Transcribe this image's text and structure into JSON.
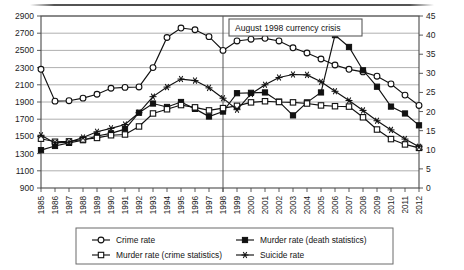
{
  "chart_data": {
    "type": "line",
    "title": "",
    "xlabel": "",
    "ylabel": "",
    "grid": true,
    "legend_position": "bottom",
    "x": [
      1985,
      1986,
      1987,
      1988,
      1989,
      1990,
      1991,
      1992,
      1993,
      1994,
      1995,
      1996,
      1997,
      1998,
      1999,
      2000,
      2001,
      2002,
      2003,
      2004,
      2005,
      2006,
      2007,
      2008,
      2009,
      2010,
      2011,
      2012
    ],
    "categories": [
      "1985",
      "1986",
      "1987",
      "1988",
      "1989",
      "1990",
      "1991",
      "1992",
      "1993",
      "1994",
      "1995",
      "1996",
      "1997",
      "1998",
      "1999",
      "2000",
      "2001",
      "2002",
      "2003",
      "2004",
      "2005",
      "2006",
      "2007",
      "2008",
      "2009",
      "2010",
      "2011",
      "2012"
    ],
    "left_axis": {
      "ticks": [
        900,
        1100,
        1300,
        1500,
        1700,
        1900,
        2100,
        2300,
        2500,
        2700,
        2900
      ],
      "ylim": [
        900,
        2900
      ],
      "label": ""
    },
    "right_axis": {
      "ticks": [
        0,
        5,
        10,
        15,
        20,
        25,
        30,
        35,
        40,
        45
      ],
      "ylim": [
        0,
        45
      ],
      "label": ""
    },
    "annotation": {
      "text": "August 1998 currency crisis",
      "marker_year": 1998
    },
    "series": [
      {
        "name": "Crime rate",
        "axis": "left",
        "marker": "open-circle",
        "values": [
          2280,
          1910,
          1915,
          1945,
          1990,
          2060,
          2070,
          2075,
          2300,
          2650,
          2760,
          2740,
          2660,
          2500,
          2610,
          2630,
          2640,
          2610,
          2530,
          2470,
          2400,
          2330,
          2280,
          2250,
          2200,
          2110,
          1980,
          1860
        ]
      },
      {
        "name": "Murder rate (death statistics)",
        "axis": "right",
        "marker": "filled-square",
        "values": [
          9.9,
          11.0,
          11.8,
          12.5,
          13.6,
          14.3,
          15.4,
          19.7,
          22.1,
          21.2,
          22.5,
          20.7,
          18.7,
          20.0,
          24.8,
          24.9,
          25.0,
          22.6,
          19.0,
          22.4,
          25.0,
          40.0,
          36.9,
          30.8,
          26.5,
          21.3,
          19.5,
          16.4
        ]
      },
      {
        "name": "Murder rate (crime statistics)",
        "axis": "right",
        "marker": "open-square",
        "values": [
          12.9,
          12.1,
          12.2,
          12.7,
          13.1,
          13.8,
          14.0,
          16.1,
          19.5,
          20.6,
          21.7,
          21.1,
          20.3,
          20.9,
          21.5,
          22.4,
          22.7,
          22.5,
          22.4,
          22.1,
          21.6,
          21.4,
          21.3,
          18.5,
          15.3,
          12.8,
          11.4,
          10.5
        ]
      },
      {
        "name": "Suicide rate",
        "axis": "right",
        "marker": "star",
        "values": [
          13.8,
          11.8,
          12.0,
          13.2,
          14.7,
          15.6,
          16.6,
          19.7,
          23.9,
          26.4,
          28.5,
          28.1,
          26.2,
          23.5,
          20.5,
          24.6,
          27.0,
          28.9,
          29.7,
          29.6,
          27.8,
          25.3,
          22.9,
          20.3,
          17.6,
          15.2,
          12.8,
          10.8
        ]
      }
    ]
  },
  "legend": {
    "entries": [
      {
        "label": "Crime rate",
        "marker": "open-circle"
      },
      {
        "label": "Murder rate (death statistics)",
        "marker": "filled-square"
      },
      {
        "label": "Murder rate (crime statistics)",
        "marker": "open-square"
      },
      {
        "label": "Suicide rate",
        "marker": "star"
      }
    ]
  }
}
